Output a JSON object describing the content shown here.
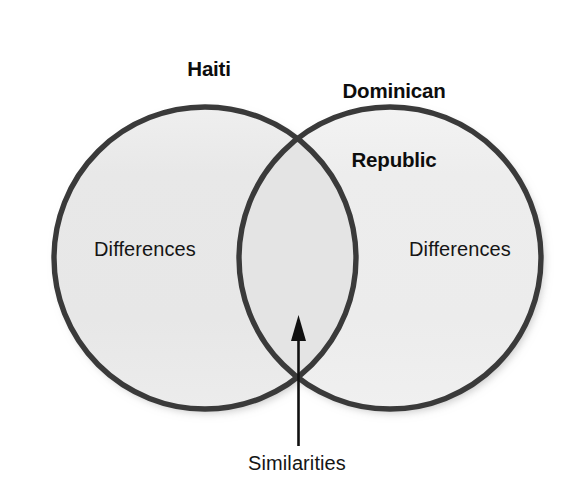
{
  "diagram": {
    "type": "venn-diagram",
    "sets": [
      {
        "id": "haiti",
        "title": "Haiti",
        "region_label": "Differences",
        "fill_color": "#e9e9e9",
        "stroke_color": "#333333"
      },
      {
        "id": "dominican-republic",
        "title": "Dominican\nRepublic",
        "title_line_1": "Dominican",
        "title_line_2": "Republic",
        "region_label": "Differences",
        "fill_color": "#eeeeee",
        "stroke_color": "#333333"
      }
    ],
    "intersection": {
      "label": "Similarities",
      "fill_color": "#e6e6e6",
      "annotation_icon": "up-arrow-icon"
    },
    "background_color": "#ffffff"
  }
}
